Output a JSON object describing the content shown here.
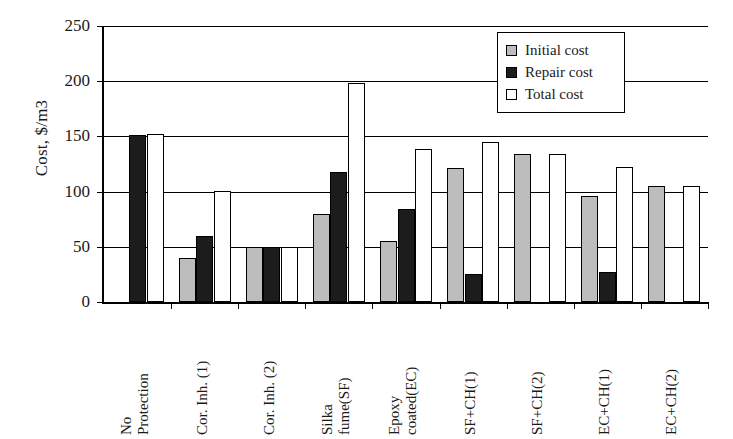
{
  "chart_data": {
    "type": "bar",
    "title": "",
    "xlabel": "",
    "ylabel": "Cost, $/m3",
    "ylim": [
      0,
      250
    ],
    "yticks": [
      0,
      50,
      100,
      150,
      200,
      250
    ],
    "ytick_labels": [
      "0",
      "50",
      "100",
      "150",
      "200",
      "250"
    ],
    "grid": true,
    "legend_position": "top-right",
    "categories": [
      "No Protection",
      "Cor. Inh. (1)",
      "Cor. Inh. (2)",
      "Silka fume(SF)",
      "Epoxy coated(EC)",
      "SF+CH(1)",
      "SF+CH(2)",
      "EC+CH(1)",
      "EC+CH(2)"
    ],
    "category_lines": [
      [
        "No",
        "Protection"
      ],
      [
        "Cor. Inh. (1)"
      ],
      [
        "Cor. Inh. (2)"
      ],
      [
        "Silka",
        "fume(SF)"
      ],
      [
        "Epoxy",
        "coated(EC)"
      ],
      [
        "SF+CH(1)"
      ],
      [
        "SF+CH(2)"
      ],
      [
        "EC+CH(1)"
      ],
      [
        "EC+CH(2)"
      ]
    ],
    "series": [
      {
        "name": "Initial cost",
        "color": "#bdbdbd",
        "values": [
          0,
          40,
          50,
          80,
          55,
          121,
          134,
          96,
          105
        ]
      },
      {
        "name": "Repair cost",
        "color": "#1c1c1c",
        "values": [
          151,
          60,
          50,
          118,
          84,
          25,
          0,
          27,
          0
        ]
      },
      {
        "name": "Total cost",
        "color": "#ffffff",
        "values": [
          152,
          101,
          50,
          198,
          139,
          145,
          134,
          122,
          105
        ]
      }
    ]
  },
  "legend": {
    "items": [
      {
        "label": "Initial cost",
        "swatch": "initial"
      },
      {
        "label": "Repair cost",
        "swatch": "repair"
      },
      {
        "label": "Total cost",
        "swatch": "total"
      }
    ]
  },
  "axes": {
    "y_title": "Cost, $/m3"
  }
}
